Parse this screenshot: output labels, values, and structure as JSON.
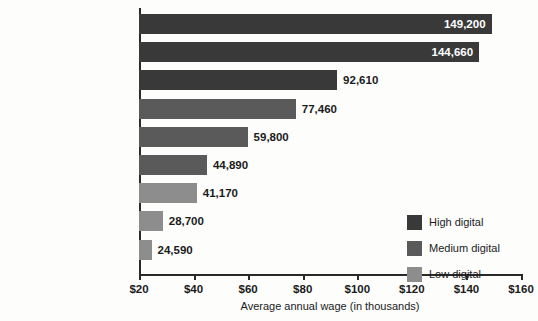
{
  "chart_data": {
    "type": "bar",
    "orientation": "horizontal",
    "title": "",
    "xlabel": "Average annual wage (in thousands)",
    "ylabel": "",
    "xlim": [
      20,
      160
    ],
    "xticks": [
      "$20",
      "$40",
      "$60",
      "$80",
      "$100",
      "$120",
      "$140",
      "$160"
    ],
    "xtick_values": [
      20,
      40,
      60,
      80,
      100,
      120,
      140,
      160
    ],
    "grid": false,
    "legend_position": "bottom-right",
    "categories": [
      "Sales managers",
      "Market research analysts and marketing",
      "Computer programmers",
      "Registered nurses",
      "Plumbers, pipefitters, and steamfitters",
      "Automotive service technicians",
      "Dental assistants",
      "Cooks, restaurant",
      "Food preparation and servers"
    ],
    "values": [
      149200,
      144660,
      92610,
      77460,
      59800,
      44890,
      41170,
      28700,
      24590
    ],
    "value_labels": [
      "149,200",
      "144,660",
      "92,610",
      "77,460",
      "59,800",
      "44,890",
      "41,170",
      "28,700",
      "24,590"
    ],
    "groups": [
      "High digital",
      "High digital",
      "High digital",
      "Medium digital",
      "Medium digital",
      "Medium digital",
      "Low digital",
      "Low digital",
      "Low digital"
    ],
    "bars": [
      {
        "label_line1": "Sales managers",
        "label_line2": "",
        "value": 149200,
        "value_label": "149,200",
        "group": "High digital",
        "label_inside": true
      },
      {
        "label_line1": "Market research analysts",
        "label_line2": "and marketing",
        "value": 144660,
        "value_label": "144,660",
        "group": "High digital",
        "label_inside": true
      },
      {
        "label_line1": "Computer programmers",
        "label_line2": "",
        "value": 92610,
        "value_label": "92,610",
        "group": "High digital",
        "label_inside": false
      },
      {
        "label_line1": "Registered nurses",
        "label_line2": "",
        "value": 77460,
        "value_label": "77,460",
        "group": "Medium digital",
        "label_inside": false
      },
      {
        "label_line1": "Plumbers, pipefitters,",
        "label_line2": "and steamfitters",
        "value": 59800,
        "value_label": "59,800",
        "group": "Medium digital",
        "label_inside": false
      },
      {
        "label_line1": "Automotive service",
        "label_line2": "technicians",
        "value": 44890,
        "value_label": "44,890",
        "group": "Medium digital",
        "label_inside": false
      },
      {
        "label_line1": "Dental assistants",
        "label_line2": "",
        "value": 41170,
        "value_label": "41,170",
        "group": "Low digital",
        "label_inside": false
      },
      {
        "label_line1": "Cooks, restaurant",
        "label_line2": "",
        "value": 28700,
        "value_label": "28,700",
        "group": "Low digital",
        "label_inside": false
      },
      {
        "label_line1": "Food preparation",
        "label_line2": "and servers",
        "value": 24590,
        "value_label": "24,590",
        "group": "Low digital",
        "label_inside": false
      }
    ],
    "legend": [
      {
        "label": "High digital",
        "color": "#393939"
      },
      {
        "label": "Medium digital",
        "color": "#5a5a5a"
      },
      {
        "label": "Low digital",
        "color": "#8d8d8d"
      }
    ],
    "colors": {
      "high_digital": "#393939",
      "medium_digital": "#5a5a5a",
      "low_digital": "#8d8d8d",
      "axis": "#2a2a2a",
      "text": "#1b1b1b",
      "background": "#fdfdfb",
      "inside_label": "#ffffff"
    }
  }
}
